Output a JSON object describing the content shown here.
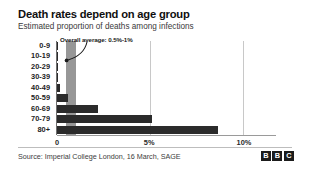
{
  "chart_data": {
    "type": "bar",
    "orientation": "horizontal",
    "title": "Death rates depend on age group",
    "subtitle": "Estimated proportion of deaths among infections",
    "xlabel": "",
    "ylabel": "",
    "xlim": [
      0,
      11.8
    ],
    "grid": true,
    "legend": "none",
    "categories": [
      "0-9",
      "10-19",
      "20-29",
      "30-39",
      "40-49",
      "50-59",
      "60-69",
      "70-79",
      "80+"
    ],
    "values": [
      0.002,
      0.006,
      0.03,
      0.08,
      0.15,
      0.6,
      2.2,
      5.1,
      8.7
    ],
    "value_unit": "%",
    "x_ticks": [
      {
        "label": "0",
        "value": 0
      },
      {
        "label": "5%",
        "value": 5
      },
      {
        "label": "10%",
        "value": 10
      }
    ],
    "annotations": [
      {
        "text": "Overall average: 0.5%-1%",
        "band_from": 0.5,
        "band_to": 1.0
      }
    ]
  },
  "header": {
    "title": "Death rates depend on age group",
    "subtitle": "Estimated proportion of deaths among infections"
  },
  "annotation": {
    "label": "Overall average: 0.5%-1%"
  },
  "footer": {
    "source": "Source: Imperial College London, 16 March, SAGE",
    "logo": [
      "B",
      "B",
      "C"
    ]
  }
}
